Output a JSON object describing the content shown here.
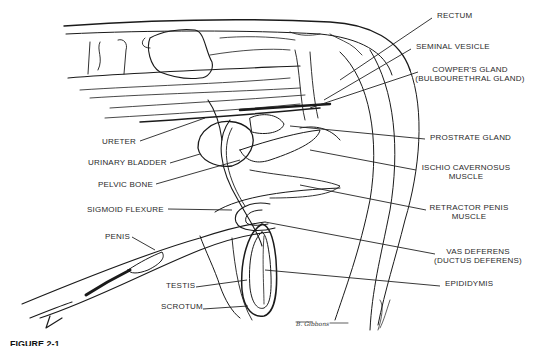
{
  "figure": {
    "caption": "FIGURE 2-1",
    "signature": "B. Gibbons",
    "ink_color": "#1a1a1a",
    "background": "#ffffff"
  },
  "labels": {
    "right": [
      {
        "id": "rectum",
        "text": "RECTUM",
        "x": 437,
        "y": 15
      },
      {
        "id": "seminal-vesicle",
        "text": "SEMINAL VESICLE",
        "x": 416,
        "y": 46
      },
      {
        "id": "cowpers-gland",
        "text": "COWPER'S GLAND",
        "sub": "(BULBOURETHRAL GLAND)",
        "x": 423,
        "y": 69
      },
      {
        "id": "prostrate-gland",
        "text": "PROSTRATE GLAND",
        "x": 430,
        "y": 136
      },
      {
        "id": "ischio-cavernosus",
        "text": "ISCHIO CAVERNOSUS",
        "sub": "MUSCLE",
        "x": 421,
        "y": 167
      },
      {
        "id": "retractor-penis",
        "text": "RETRACTOR PENIS",
        "sub": "MUSCLE",
        "x": 431,
        "y": 207
      },
      {
        "id": "vas-deferens",
        "text": "VAS DEFERENS",
        "sub": "(DUCTUS DEFERENS)",
        "x": 440,
        "y": 251
      },
      {
        "id": "epididymis",
        "text": "EPIDIDYMIS",
        "x": 445,
        "y": 283
      }
    ],
    "left": [
      {
        "id": "ureter",
        "text": "URETER",
        "x": 102,
        "y": 140
      },
      {
        "id": "urinary-bladder",
        "text": "URINARY BLADDER",
        "x": 88,
        "y": 162
      },
      {
        "id": "pelvic-bone",
        "text": "PELVIC BONE",
        "x": 98,
        "y": 183
      },
      {
        "id": "sigmoid-flexure",
        "text": "SIGMOID FLEXURE",
        "x": 87,
        "y": 208
      },
      {
        "id": "penis",
        "text": "PENIS",
        "x": 105,
        "y": 236
      },
      {
        "id": "testis",
        "text": "TESTIS",
        "x": 166,
        "y": 284
      },
      {
        "id": "scrotum",
        "text": "SCROTUM",
        "x": 161,
        "y": 306
      }
    ]
  }
}
